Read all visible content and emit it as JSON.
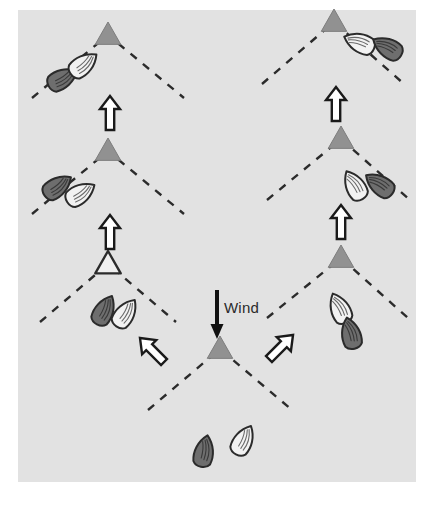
{
  "figure": {
    "background_color": "#ffffff",
    "canvas_color": "#e2e2e2",
    "canvas": {
      "x": 18,
      "y": 10,
      "width": 398,
      "height": 472
    }
  },
  "palette": {
    "mark_fill": "#919191",
    "mark_stroke": "#7d7d7d",
    "open_mark_fill": "#efefef",
    "open_mark_stroke": "#2b2b2b",
    "dashed_line": "#2b2b2b",
    "boat_dark_fill": "#6e6e6e",
    "boat_light_fill": "#f2f2f2",
    "boat_stroke": "#2b2b2b",
    "arrow_fill": "#ffffff",
    "arrow_stroke": "#1a1a1a",
    "wind_arrow_color": "#111111",
    "wind_text_color": "#2b2b2b"
  },
  "wind": {
    "label": "Wind",
    "label_x": 224,
    "label_y": 313,
    "arrow_direction": "down",
    "arrow_x": 217,
    "arrow_top_y": 290,
    "arrow_bottom_y": 339
  },
  "marks": [
    {
      "name": "mark-start-bottom-center",
      "x": 220,
      "y": 349,
      "style": "filled",
      "size": 13
    },
    {
      "name": "mark-left-lower",
      "x": 108,
      "y": 264,
      "style": "open",
      "size": 13
    },
    {
      "name": "mark-left-middle",
      "x": 108,
      "y": 151,
      "style": "filled",
      "size": 13
    },
    {
      "name": "mark-left-upper",
      "x": 108,
      "y": 35,
      "style": "filled",
      "size": 13
    },
    {
      "name": "mark-right-lower",
      "x": 341,
      "y": 258,
      "style": "filled",
      "size": 13
    },
    {
      "name": "mark-right-middle",
      "x": 341,
      "y": 139,
      "style": "filled",
      "size": 13
    },
    {
      "name": "mark-right-upper",
      "x": 334,
      "y": 22,
      "style": "filled",
      "size": 13
    }
  ],
  "tack_laylines": [
    {
      "name": "layline-bottom-center",
      "apex_x": 220,
      "apex_y": 349,
      "left_x": 148,
      "left_y": 410,
      "right_x": 292,
      "right_y": 410
    },
    {
      "name": "layline-left-lower",
      "apex_x": 108,
      "apex_y": 264,
      "left_x": 40,
      "left_y": 322,
      "right_x": 176,
      "right_y": 322
    },
    {
      "name": "layline-left-middle",
      "apex_x": 108,
      "apex_y": 151,
      "left_x": 32,
      "left_y": 214,
      "right_x": 184,
      "right_y": 214
    },
    {
      "name": "layline-left-upper",
      "apex_x": 108,
      "apex_y": 35,
      "left_x": 32,
      "left_y": 98,
      "right_x": 184,
      "right_y": 98
    },
    {
      "name": "layline-right-lower",
      "apex_x": 341,
      "apex_y": 258,
      "left_x": 267,
      "left_y": 318,
      "right_x": 408,
      "right_y": 318
    },
    {
      "name": "layline-right-middle",
      "apex_x": 341,
      "apex_y": 139,
      "left_x": 267,
      "left_y": 200,
      "right_x": 410,
      "right_y": 200
    },
    {
      "name": "layline-right-upper",
      "apex_x": 334,
      "apex_y": 22,
      "left_x": 262,
      "left_y": 84,
      "right_x": 404,
      "right_y": 84
    }
  ],
  "course_arrows": [
    {
      "name": "course-arrow-bottom-left",
      "x": 152,
      "y": 350,
      "rotation": -45,
      "direction": "up-left"
    },
    {
      "name": "course-arrow-bottom-right",
      "x": 281,
      "y": 347,
      "rotation": 45,
      "direction": "up-right"
    },
    {
      "name": "course-arrow-left-lower",
      "x": 110,
      "y": 232,
      "rotation": 0,
      "direction": "up"
    },
    {
      "name": "course-arrow-left-upper",
      "x": 110,
      "y": 113,
      "rotation": 0,
      "direction": "up"
    },
    {
      "name": "course-arrow-right-lower",
      "x": 341,
      "y": 222,
      "rotation": 0,
      "direction": "up"
    },
    {
      "name": "course-arrow-right-upper",
      "x": 336,
      "y": 104,
      "rotation": 0,
      "direction": "up"
    }
  ],
  "boats": [
    {
      "name": "boat-bottom-center-dark",
      "x": 204,
      "y": 452,
      "rotation": 12,
      "shade": "dark"
    },
    {
      "name": "boat-bottom-center-light",
      "x": 243,
      "y": 441,
      "rotation": 28,
      "shade": "light"
    },
    {
      "name": "boat-left-lower-dark",
      "x": 104,
      "y": 311,
      "rotation": 28,
      "shade": "dark"
    },
    {
      "name": "boat-left-lower-light",
      "x": 125,
      "y": 314,
      "rotation": 35,
      "shade": "light"
    },
    {
      "name": "boat-left-middle-dark",
      "x": 57,
      "y": 187,
      "rotation": 55,
      "shade": "dark"
    },
    {
      "name": "boat-left-middle-light",
      "x": 80,
      "y": 194,
      "rotation": 58,
      "shade": "light"
    },
    {
      "name": "boat-left-upper-dark",
      "x": 62,
      "y": 79,
      "rotation": 62,
      "shade": "dark"
    },
    {
      "name": "boat-left-upper-light",
      "x": 83,
      "y": 65,
      "rotation": 52,
      "shade": "light"
    },
    {
      "name": "boat-right-lower-light",
      "x": 340,
      "y": 309,
      "rotation": -25,
      "shade": "light"
    },
    {
      "name": "boat-right-lower-dark",
      "x": 351,
      "y": 334,
      "rotation": -14,
      "shade": "dark"
    },
    {
      "name": "boat-right-middle-light",
      "x": 355,
      "y": 186,
      "rotation": -30,
      "shade": "light"
    },
    {
      "name": "boat-right-middle-dark",
      "x": 380,
      "y": 185,
      "rotation": -55,
      "shade": "dark"
    },
    {
      "name": "boat-right-upper-light",
      "x": 360,
      "y": 43,
      "rotation": -68,
      "shade": "light"
    },
    {
      "name": "boat-right-upper-dark",
      "x": 388,
      "y": 48,
      "rotation": -60,
      "shade": "dark"
    }
  ]
}
